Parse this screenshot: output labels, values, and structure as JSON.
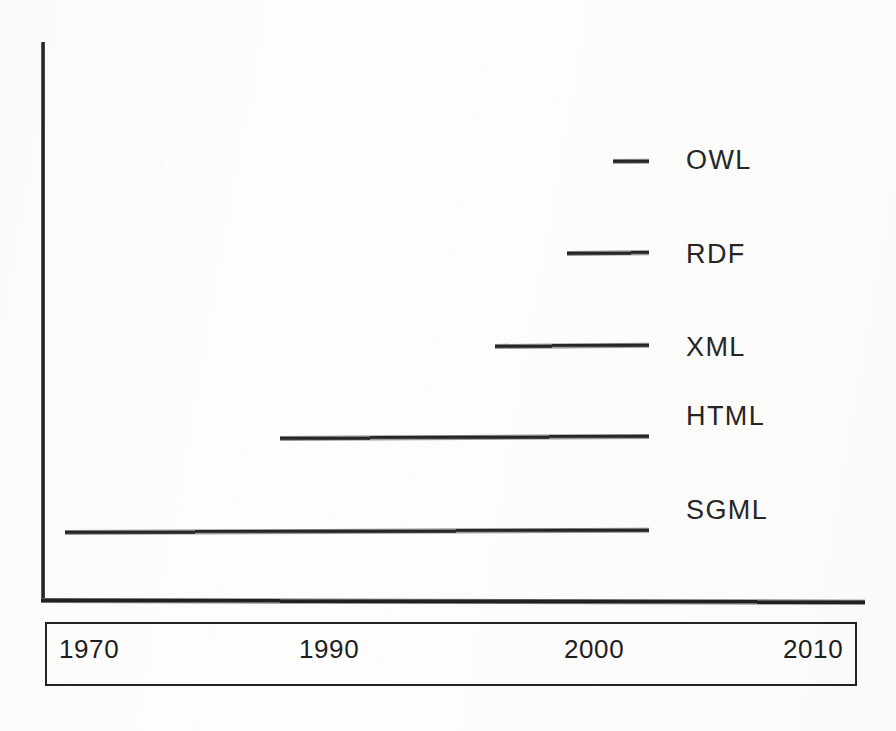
{
  "figure": {
    "background_color": "#fdfdfc",
    "ink_color": "#262626"
  },
  "chart_data": {
    "type": "bar",
    "orientation": "horizontal",
    "title": "",
    "subtitle": "",
    "xlabel": "",
    "ylabel": "",
    "grid": false,
    "legend": "none",
    "xlim": [
      1965,
      2012
    ],
    "x_tick_labels": [
      "1970",
      "1990",
      "2000",
      "2010"
    ],
    "x_tick_values": [
      1970,
      1990,
      2000,
      2010
    ],
    "categories": [
      "OWL",
      "RDF",
      "XML",
      "HTML",
      "SGML"
    ],
    "note": "Each horizontal rule spans the lifetime of a markup language from its introduction year to the present (right edge shared at ~2004).",
    "bars": [
      {
        "label": "OWL",
        "start": 2002,
        "end": 2004,
        "span_years": 2
      },
      {
        "label": "RDF",
        "start": 1999,
        "end": 2004,
        "span_years": 5
      },
      {
        "label": "XML",
        "start": 1995,
        "end": 2004,
        "span_years": 9
      },
      {
        "label": "HTML",
        "start": 1989,
        "end": 2004,
        "span_years": 15
      },
      {
        "label": "SGML",
        "start": 1970,
        "end": 2004,
        "span_years": 34
      }
    ],
    "series": [
      {
        "name": "lifespan_start",
        "values": [
          2002,
          1999,
          1995,
          1989,
          1970
        ]
      },
      {
        "name": "lifespan_end",
        "values": [
          2004,
          2004,
          2004,
          2004,
          2004
        ]
      }
    ]
  },
  "axes": {
    "y_axis_name": "y-axis",
    "x_axis_name": "x-axis"
  },
  "year_axis": {
    "ticks": [
      {
        "label": "1970"
      },
      {
        "label": "1990"
      },
      {
        "label": "2000"
      },
      {
        "label": "2010"
      }
    ]
  },
  "labels": {
    "owl": "OWL",
    "rdf": "RDF",
    "xml": "XML",
    "html": "HTML",
    "sgml": "SGML"
  }
}
